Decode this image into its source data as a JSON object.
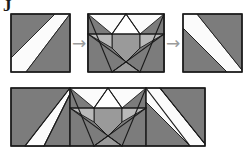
{
  "figure": {
    "title_mark": "J",
    "canvas": {
      "width": 250,
      "height": 155,
      "background": "#ffffff"
    },
    "palette": {
      "dark_gray": "#7c7c7c",
      "mid_gray": "#9a9a9a",
      "light_gray": "#b9b9b9",
      "pale_gray": "#d2d2d2",
      "white": "#fbfbfb",
      "outline": "#1a1a1a",
      "arrow": "#9b9b9b"
    },
    "arrows": [
      {
        "name": "arrow-1",
        "glyph": "→",
        "x": 72,
        "y": 35,
        "width": 14,
        "height": 16
      },
      {
        "name": "arrow-2",
        "glyph": "→",
        "x": 166,
        "y": 35,
        "width": 14,
        "height": 16
      }
    ],
    "panels": [
      {
        "name": "block-left",
        "label": "half-square-stripe block",
        "x": 11,
        "y": 14,
        "width": 59,
        "height": 58,
        "shapes": [
          {
            "name": "dark-upper-left-triangle",
            "fill": "dark_gray",
            "points": "0,0 44,0 0,44"
          },
          {
            "name": "white-diagonal-band",
            "fill": "white",
            "points": "44,0 59,0 15,58 0,58 0,44"
          },
          {
            "name": "dark-lower-right-triangle",
            "fill": "dark_gray",
            "points": "59,0 59,58 15,58"
          }
        ]
      },
      {
        "name": "block-middle",
        "label": "double-peak crossed block",
        "x": 88,
        "y": 14,
        "width": 76,
        "height": 58,
        "shapes": [
          {
            "name": "white-upper-left-wedge",
            "fill": "white",
            "points": "0,0 38,0 24,20 0,20"
          },
          {
            "name": "white-upper-right-wedge",
            "fill": "white",
            "points": "38,0 76,0 76,20 52,20"
          },
          {
            "name": "dark-left-edge-triangle",
            "fill": "dark_gray",
            "points": "0,0 0,58 24,20"
          },
          {
            "name": "dark-right-edge-triangle",
            "fill": "dark_gray",
            "points": "76,0 76,58 52,20"
          },
          {
            "name": "mid-center-band",
            "fill": "mid_gray",
            "points": "24,20 52,20 52,34 38,48 24,34"
          },
          {
            "name": "light-left-peak",
            "fill": "light_gray",
            "points": "0,20 24,20 24,58"
          },
          {
            "name": "light-right-peak",
            "fill": "light_gray",
            "points": "76,20 52,20 52,58"
          },
          {
            "name": "dark-bottom-left-wedge",
            "fill": "dark_gray",
            "points": "0,58 24,58 38,48 24,34 0,20"
          },
          {
            "name": "dark-bottom-right-wedge",
            "fill": "dark_gray",
            "points": "76,58 52,58 38,48 52,34 76,20"
          },
          {
            "name": "mid-bottom-notch",
            "fill": "mid_gray",
            "points": "24,58 52,58 38,48"
          }
        ],
        "lines": [
          {
            "name": "diagonal-left-down",
            "x1": 0,
            "y1": 20,
            "x2": 52,
            "y2": 58
          },
          {
            "name": "diagonal-right-down",
            "x1": 76,
            "y1": 20,
            "x2": 24,
            "y2": 58
          },
          {
            "name": "diagonal-left-top",
            "x1": 0,
            "y1": 0,
            "x2": 24,
            "y2": 58
          },
          {
            "name": "diagonal-right-top",
            "x1": 76,
            "y1": 0,
            "x2": 52,
            "y2": 58
          },
          {
            "name": "shoulder-left",
            "x1": 0,
            "y1": 20,
            "x2": 24,
            "y2": 20
          },
          {
            "name": "shoulder-right",
            "x1": 52,
            "y1": 20,
            "x2": 76,
            "y2": 20
          },
          {
            "name": "center-top",
            "x1": 24,
            "y1": 20,
            "x2": 52,
            "y2": 20
          },
          {
            "name": "apex-left",
            "x1": 38,
            "y1": 0,
            "x2": 24,
            "y2": 20
          },
          {
            "name": "apex-right",
            "x1": 38,
            "y1": 0,
            "x2": 52,
            "y2": 20
          }
        ]
      },
      {
        "name": "block-right",
        "label": "mirrored half-square-stripe block",
        "x": 183,
        "y": 14,
        "width": 59,
        "height": 58,
        "shapes": [
          {
            "name": "white-diagonal-band",
            "fill": "white",
            "points": "0,0 14,0 59,56 59,58 44,58 0,14"
          },
          {
            "name": "dark-upper-right-triangle",
            "fill": "dark_gray",
            "points": "14,0 59,0 59,56"
          },
          {
            "name": "dark-lower-left-triangle",
            "fill": "dark_gray",
            "points": "0,14 44,58 0,58"
          }
        ]
      },
      {
        "name": "assembled-row",
        "label": "assembled block row",
        "x": 11,
        "y": 88,
        "width": 194,
        "height": 58,
        "shapes": [
          {
            "name": "left-dark-upper",
            "fill": "dark_gray",
            "points": "0,0 0,58 33,58 59,0"
          },
          {
            "name": "left-white-band",
            "fill": "white",
            "points": "59,0 59,6 33,58 14,58"
          },
          {
            "name": "left-dark-lower-corner",
            "fill": "dark_gray",
            "points": "59,6 59,58 33,58"
          },
          {
            "name": "mid-white-upper-left",
            "fill": "white",
            "points": "59,0 97,0 83,20 59,20"
          },
          {
            "name": "mid-white-upper-right",
            "fill": "white",
            "points": "97,0 135,0 135,20 111,20"
          },
          {
            "name": "mid-dark-left-edge",
            "fill": "dark_gray",
            "points": "59,0 59,58 83,20"
          },
          {
            "name": "mid-dark-right-edge",
            "fill": "dark_gray",
            "points": "135,0 135,58 111,20"
          },
          {
            "name": "mid-center-band",
            "fill": "mid_gray",
            "points": "83,20 111,20 111,34 97,48 83,34"
          },
          {
            "name": "mid-light-left-peak",
            "fill": "light_gray",
            "points": "59,20 83,20 83,58"
          },
          {
            "name": "mid-light-right-peak",
            "fill": "light_gray",
            "points": "135,20 111,20 111,58"
          },
          {
            "name": "mid-dark-bottom-left",
            "fill": "dark_gray",
            "points": "59,58 83,58 97,48 83,34 59,20"
          },
          {
            "name": "mid-dark-bottom-right",
            "fill": "dark_gray",
            "points": "135,58 111,58 97,48 111,34 135,20"
          },
          {
            "name": "mid-bottom-notch",
            "fill": "mid_gray",
            "points": "83,58 111,58 97,48"
          },
          {
            "name": "right-white-band",
            "fill": "white",
            "points": "135,0 149,0 194,56 194,58 179,58 135,14"
          },
          {
            "name": "right-dark-upper",
            "fill": "dark_gray",
            "points": "149,0 194,0 194,56"
          },
          {
            "name": "right-dark-lower",
            "fill": "dark_gray",
            "points": "135,14 179,58 135,58"
          }
        ],
        "lines": [
          {
            "name": "seam-left",
            "x1": 59,
            "y1": 0,
            "x2": 59,
            "y2": 58
          },
          {
            "name": "seam-right",
            "x1": 135,
            "y1": 0,
            "x2": 135,
            "y2": 58
          },
          {
            "name": "mid-diagonal-left-down",
            "x1": 59,
            "y1": 20,
            "x2": 111,
            "y2": 58
          },
          {
            "name": "mid-diagonal-right-down",
            "x1": 135,
            "y1": 20,
            "x2": 83,
            "y2": 58
          },
          {
            "name": "mid-diagonal-left-top",
            "x1": 59,
            "y1": 0,
            "x2": 83,
            "y2": 58
          },
          {
            "name": "mid-diagonal-right-top",
            "x1": 135,
            "y1": 0,
            "x2": 111,
            "y2": 58
          },
          {
            "name": "mid-shoulder-left",
            "x1": 59,
            "y1": 20,
            "x2": 83,
            "y2": 20
          },
          {
            "name": "mid-shoulder-right",
            "x1": 111,
            "y1": 20,
            "x2": 135,
            "y2": 20
          },
          {
            "name": "mid-center-top",
            "x1": 83,
            "y1": 20,
            "x2": 111,
            "y2": 20
          },
          {
            "name": "mid-apex-left",
            "x1": 97,
            "y1": 0,
            "x2": 83,
            "y2": 20
          },
          {
            "name": "mid-apex-right",
            "x1": 97,
            "y1": 0,
            "x2": 111,
            "y2": 20
          },
          {
            "name": "left-band-top",
            "x1": 59,
            "y1": 0,
            "x2": 14,
            "y2": 58
          },
          {
            "name": "left-band-bottom",
            "x1": 59,
            "y1": 6,
            "x2": 33,
            "y2": 58
          },
          {
            "name": "right-band-top",
            "x1": 135,
            "y1": 0,
            "x2": 179,
            "y2": 58
          },
          {
            "name": "right-band-bottom",
            "x1": 149,
            "y1": 0,
            "x2": 194,
            "y2": 56
          }
        ]
      }
    ]
  }
}
